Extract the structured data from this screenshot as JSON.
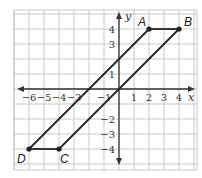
{
  "graph": {
    "axes": {
      "x_label": "x",
      "y_label": "y",
      "x_range": [
        -7,
        5
      ],
      "y_range": [
        -5,
        5
      ],
      "x_tick_labels": [
        {
          "value": -6,
          "text": "−6"
        },
        {
          "value": -5,
          "text": "−5"
        },
        {
          "value": -4,
          "text": "−4"
        },
        {
          "value": -3,
          "text": "−3"
        },
        {
          "value": -1,
          "text": "−1"
        },
        {
          "value": 1,
          "text": "1"
        },
        {
          "value": 2,
          "text": "2"
        },
        {
          "value": 3,
          "text": "3"
        },
        {
          "value": 4,
          "text": "4"
        }
      ],
      "y_tick_labels": [
        {
          "value": 4,
          "text": "4"
        },
        {
          "value": 3,
          "text": "3"
        },
        {
          "value": 1,
          "text": "1"
        },
        {
          "value": -2,
          "text": "−2"
        },
        {
          "value": -3,
          "text": "−3"
        },
        {
          "value": -4,
          "text": "−4"
        }
      ]
    },
    "points": [
      {
        "name": "A",
        "x": 2,
        "y": 4
      },
      {
        "name": "B",
        "x": 4,
        "y": 4
      },
      {
        "name": "C",
        "x": -4,
        "y": -4
      },
      {
        "name": "D",
        "x": -6,
        "y": -4
      }
    ],
    "segments": [
      [
        "A",
        "B"
      ],
      [
        "B",
        "C"
      ],
      [
        "C",
        "D"
      ],
      [
        "D",
        "A"
      ]
    ],
    "colors": {
      "grid": "#c8c8c8",
      "axis": "#333333",
      "shape": "#222222"
    }
  }
}
